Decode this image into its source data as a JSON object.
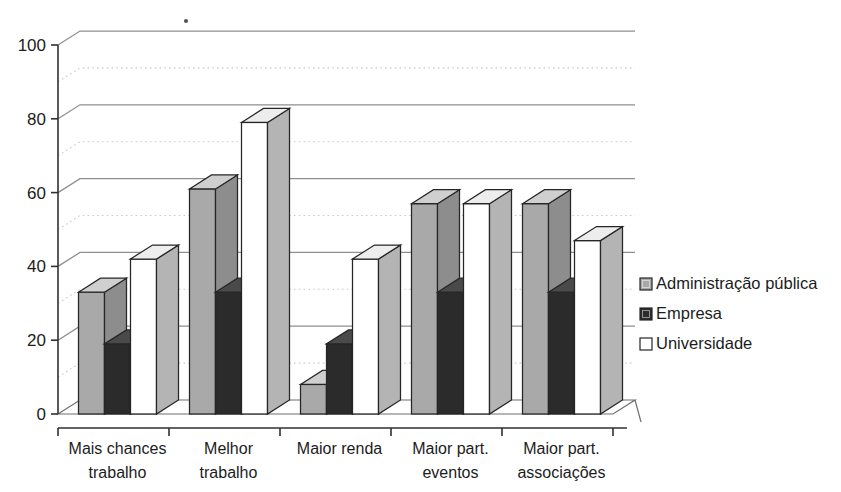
{
  "chart_data": {
    "type": "bar",
    "title": "",
    "subtitle": "",
    "xlabel": "",
    "ylabel": "",
    "ylim": [
      0,
      100
    ],
    "ytick_labels": [
      "0",
      "20",
      "40",
      "60",
      "80",
      "100"
    ],
    "ytick_values": [
      0,
      20,
      40,
      60,
      80,
      100
    ],
    "minor_gridlines": [
      10,
      30,
      50,
      70,
      90
    ],
    "grid": "horizontal-major-solid-minor-dotted",
    "legend_position": "right",
    "three_d": true,
    "categories": [
      "Mais chances trabalho",
      "Melhor trabalho",
      "Maior renda",
      "Maior part. eventos",
      "Maior part. associações"
    ],
    "category_lines": [
      [
        "Mais chances",
        "trabalho"
      ],
      [
        "Melhor",
        "trabalho"
      ],
      [
        "Maior renda",
        ""
      ],
      [
        "Maior part.",
        "eventos"
      ],
      [
        "Maior part.",
        "associações"
      ]
    ],
    "series": [
      {
        "name": "Administração pública",
        "color": "#a9a9a9",
        "values": [
          33,
          61,
          8,
          57,
          57
        ]
      },
      {
        "name": "Empresa",
        "color": "#2b2b2b",
        "values": [
          19,
          33,
          19,
          33,
          33
        ]
      },
      {
        "name": "Universidade",
        "color": "#ffffff",
        "values": [
          42,
          79,
          42,
          57,
          47
        ]
      }
    ]
  },
  "legend": {
    "items": [
      {
        "label": "Administração pública",
        "swatch": "#a9a9a9"
      },
      {
        "label": "Empresa",
        "swatch": "#2b2b2b"
      },
      {
        "label": "Universidade",
        "swatch": "#ffffff"
      }
    ]
  },
  "axis": {
    "y_ticks": [
      "0",
      "20",
      "40",
      "60",
      "80",
      "100"
    ]
  }
}
